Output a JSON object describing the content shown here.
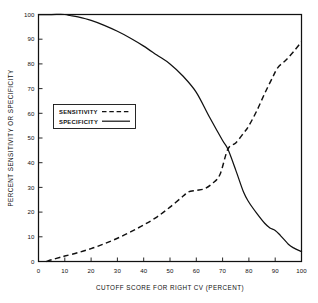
{
  "chart_data": {
    "type": "line",
    "title": "",
    "xlabel": "CUTOFF SCORE FOR RIGHT CV (PERCENT)",
    "ylabel": "PERCENT SENSITIVITY OR SPECIFICITY",
    "xlim": [
      0,
      100
    ],
    "ylim": [
      0,
      100
    ],
    "xticks": [
      0,
      10,
      20,
      30,
      40,
      50,
      60,
      70,
      80,
      90,
      100
    ],
    "xtick_labels": [
      "0",
      "10",
      "20",
      "30",
      "40",
      "50",
      "60",
      "70",
      "80",
      "90",
      "100"
    ],
    "yticks": [
      0,
      10,
      20,
      30,
      40,
      50,
      60,
      70,
      80,
      90,
      100
    ],
    "ytick_labels": [
      "0",
      "10",
      "20",
      "30",
      "40",
      "50",
      "60",
      "70",
      "80",
      "90",
      "100"
    ],
    "grid": false,
    "legend_position": "upper left inside",
    "series": [
      {
        "name": "SENSITIVITY",
        "style": "dashed",
        "color": "#111111",
        "x": [
          3,
          5,
          8,
          10,
          15,
          20,
          25,
          30,
          35,
          40,
          45,
          50,
          55,
          57,
          60,
          63,
          66,
          69,
          72,
          75,
          78,
          80,
          83,
          86,
          89,
          91,
          94,
          97,
          100
        ],
        "y": [
          0,
          0.7,
          1.6,
          2.2,
          3.6,
          5.2,
          7.2,
          9.4,
          12.0,
          14.8,
          18.0,
          22.0,
          26.5,
          28.2,
          28.8,
          29.4,
          31.5,
          35.2,
          45.5,
          48.0,
          52.0,
          55.0,
          61.0,
          68.0,
          74.5,
          78.5,
          81.5,
          85.0,
          89.0
        ]
      },
      {
        "name": "SPECIFICITY",
        "style": "solid",
        "color": "#111111",
        "x": [
          0,
          5,
          10,
          12,
          15,
          20,
          25,
          30,
          35,
          40,
          45,
          50,
          55,
          60,
          65,
          70,
          72,
          75,
          78,
          80,
          83,
          86,
          88,
          90,
          92,
          95,
          97,
          100
        ],
        "y": [
          100,
          100,
          100,
          99.6,
          99.0,
          97.6,
          95.6,
          93.2,
          90.4,
          87.2,
          83.6,
          80.0,
          75.0,
          68.5,
          58.5,
          49.0,
          45.5,
          37.0,
          28.0,
          24.0,
          19.5,
          15.5,
          13.6,
          12.6,
          10.5,
          7.0,
          5.5,
          4.0
        ]
      }
    ],
    "annotations": {
      "crossover_x": 72,
      "crossover_y": 46
    }
  },
  "legend": {
    "entries": [
      {
        "label": "SENSITIVITY",
        "style": "dashed"
      },
      {
        "label": "SPECIFICITY",
        "style": "solid"
      }
    ]
  }
}
